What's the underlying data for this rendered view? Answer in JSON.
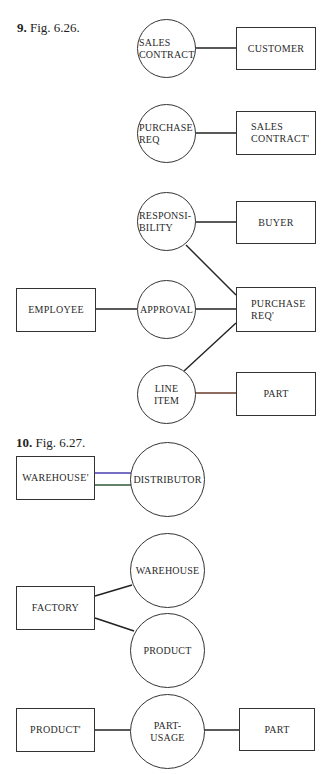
{
  "figures": [
    {
      "number": "9.",
      "caption": "Fig. 6.26.",
      "entities": {
        "customer": "CUSTOMER",
        "sales_contract_prime": "SALES\nCONTRACT'",
        "buyer": "BUYER",
        "employee": "EMPLOYEE",
        "purchase_req_prime": "PURCHASE\nREQ'",
        "part": "PART"
      },
      "relationships": {
        "sales_contract": "SALES\nCONTRACT",
        "purchase_req": "PURCHASE\nREQ",
        "responsibility": "RESPONSI-\nBILITY",
        "approval": "APPROVAL",
        "line_item": "LINE\nITEM"
      }
    },
    {
      "number": "10.",
      "caption": "Fig. 6.27.",
      "entities": {
        "warehouse_prime": "WAREHOUSE'",
        "factory": "FACTORY",
        "product_prime": "PRODUCT'",
        "part": "PART"
      },
      "relationships": {
        "distributor": "DISTRIBUTOR",
        "warehouse": "WAREHOUSE",
        "product": "PRODUCT",
        "part_usage": "PART-\nUSAGE"
      }
    }
  ],
  "colors": {
    "line": "#222222",
    "double_line_top": "#4a3fb0",
    "double_line_bottom": "#2f5a3a",
    "part_line": "#6a3a2a"
  }
}
